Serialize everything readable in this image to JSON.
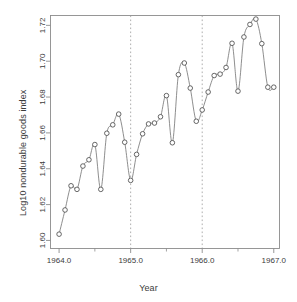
{
  "chart_data": {
    "type": "scatter",
    "title": "",
    "xlabel": "Year",
    "ylabel": "Log10 nondurable goods index",
    "xlim": [
      1963.88,
      1967.08
    ],
    "ylim": [
      1.5955,
      1.7255
    ],
    "grid": false,
    "legend": null,
    "x_major_ticks": [
      1964.0,
      1965.0,
      1966.0,
      1967.0
    ],
    "x_major_tick_labels": [
      "1964.0",
      "1965.0",
      "1966.0",
      "1967.0"
    ],
    "x_minor_ticks": [
      1964.5,
      1965.5,
      1966.5
    ],
    "y_ticks": [
      1.6,
      1.62,
      1.64,
      1.66,
      1.68,
      1.7,
      1.72
    ],
    "y_tick_labels": [
      "1.60",
      "1.62",
      "1.64",
      "1.66",
      "1.68",
      "1.70",
      "1.72"
    ],
    "annotations": [
      {
        "kind": "vertical-dashed-line",
        "x": 1965.0
      },
      {
        "kind": "vertical-dashed-line",
        "x": 1966.0
      }
    ],
    "marker": "open-circle",
    "line": "smooth-interpolating-curve",
    "point_color": "#4d4d4d",
    "line_color": "#7a7a7a",
    "axis_color": "#8c8c8c",
    "x": [
      1964.0,
      1964.083,
      1964.167,
      1964.25,
      1964.333,
      1964.417,
      1964.5,
      1964.583,
      1964.667,
      1964.75,
      1964.833,
      1964.917,
      1965.0,
      1965.083,
      1965.167,
      1965.25,
      1965.333,
      1965.417,
      1965.5,
      1965.583,
      1965.667,
      1965.75,
      1965.833,
      1965.917,
      1966.0,
      1966.083,
      1966.167,
      1966.25,
      1966.333,
      1966.417,
      1966.5,
      1966.583,
      1966.667,
      1966.75,
      1966.833,
      1966.917,
      1967.0
    ],
    "y": [
      1.6035,
      1.617,
      1.6305,
      1.6285,
      1.6415,
      1.645,
      1.6535,
      1.6285,
      1.6598,
      1.6645,
      1.6705,
      1.6548,
      1.6335,
      1.648,
      1.6595,
      1.665,
      1.6655,
      1.669,
      1.6808,
      1.6545,
      1.6925,
      1.699,
      1.685,
      1.6665,
      1.6728,
      1.6828,
      1.692,
      1.6928,
      1.6965,
      1.71,
      1.6833,
      1.7135,
      1.7205,
      1.7235,
      1.7098,
      1.6855,
      1.6855
    ],
    "series": [
      {
        "name": "Log10 nondurable goods index",
        "values": [
          1.6035,
          1.617,
          1.6305,
          1.6285,
          1.6415,
          1.645,
          1.6535,
          1.6285,
          1.6598,
          1.6645,
          1.6705,
          1.6548,
          1.6335,
          1.648,
          1.6595,
          1.665,
          1.6655,
          1.669,
          1.6808,
          1.6545,
          1.6925,
          1.699,
          1.685,
          1.6665,
          1.6728,
          1.6828,
          1.692,
          1.6928,
          1.6965,
          1.71,
          1.6833,
          1.7135,
          1.7205,
          1.7235,
          1.7098,
          1.6855,
          1.6855
        ]
      }
    ]
  }
}
